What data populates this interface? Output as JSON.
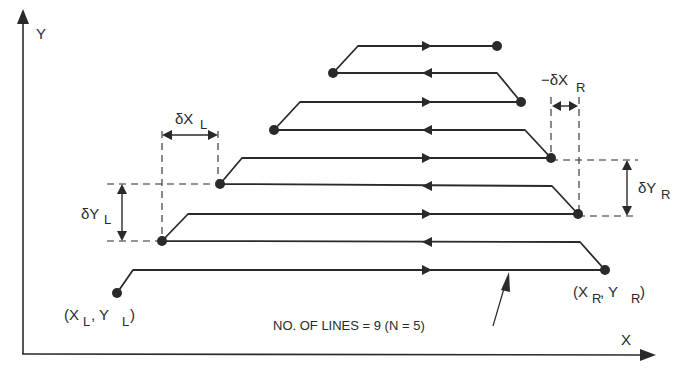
{
  "axes": {
    "x_label": "X",
    "y_label": "Y"
  },
  "start_point": {
    "paren_open": "(X",
    "x_sub": "L",
    "sep": ", Y",
    "y_sub": "L",
    "paren_close": ")"
  },
  "end_point": {
    "paren_open": "(X",
    "x_sub": "R",
    "sep": ", Y",
    "y_sub": "R",
    "paren_close": ")"
  },
  "dimensions": {
    "dx_left": {
      "main": "δX",
      "sub": "L"
    },
    "dy_left": {
      "main": "δY",
      "sub": "L"
    },
    "dx_right": {
      "main": "−δX",
      "sub": "R"
    },
    "dy_right": {
      "main": "δY",
      "sub": "R"
    }
  },
  "annotation": "NO. OF LINES = 9 (N = 5)",
  "scan_lines": {
    "count": 9,
    "n": 5,
    "directions": [
      "right",
      "left",
      "right",
      "left",
      "right",
      "left",
      "right",
      "left",
      "right"
    ]
  },
  "colors": {
    "ink": "#2a2a2a",
    "background": "#ffffff"
  }
}
